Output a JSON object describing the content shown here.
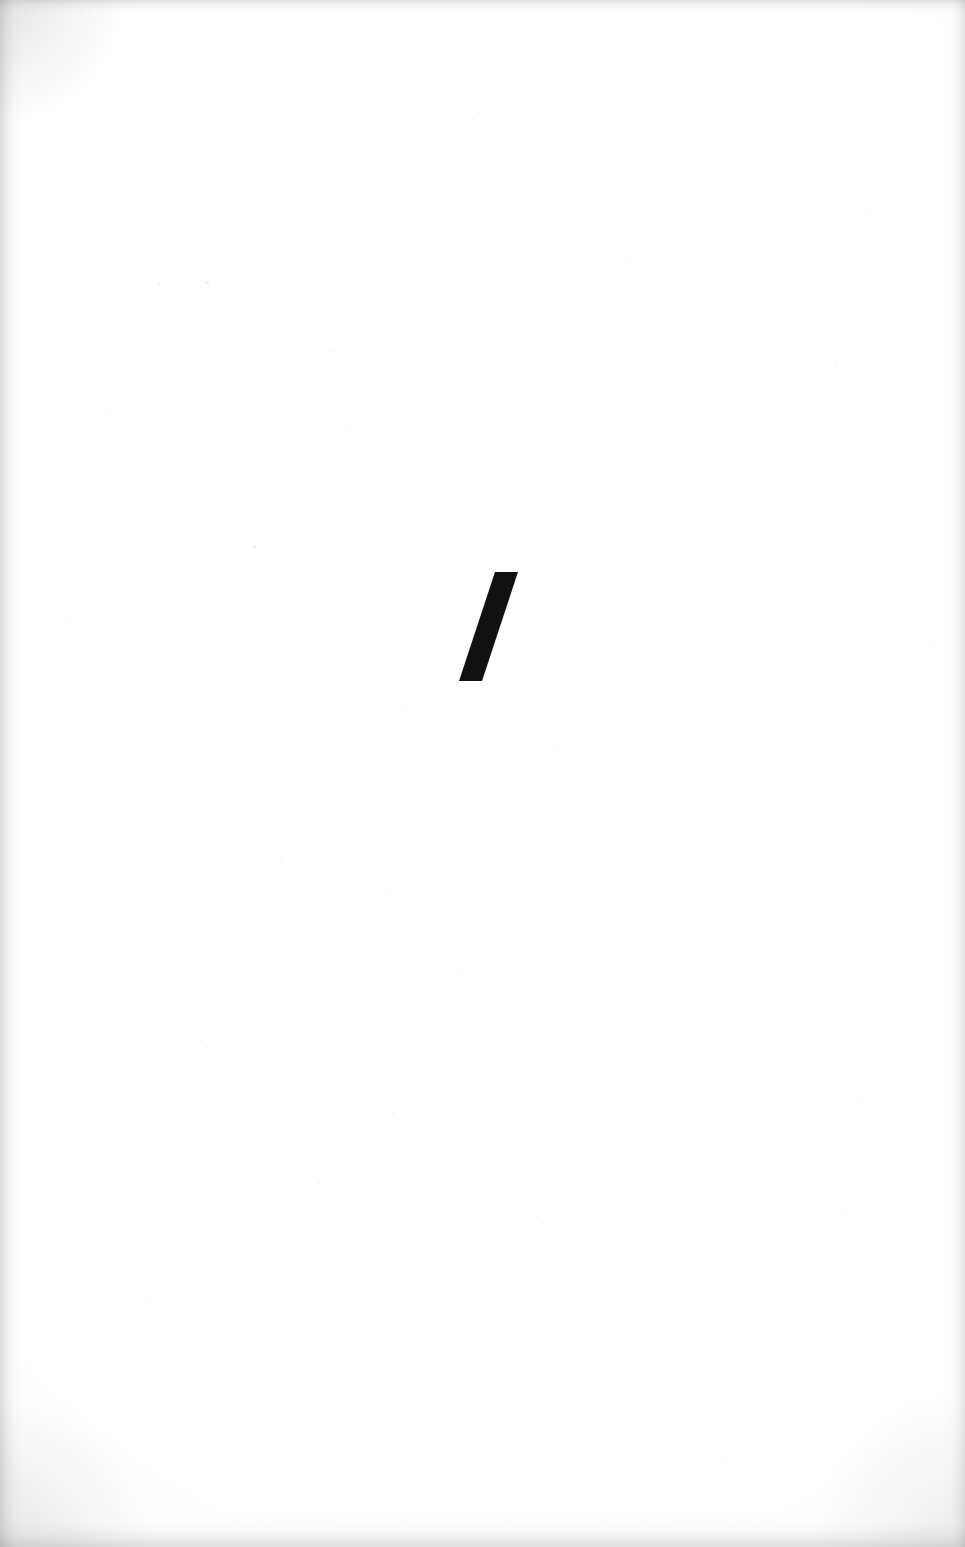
{
  "document": {
    "kind": "scanned-page",
    "page_background_color": "#fefefe",
    "canvas_width": 965,
    "canvas_height": 1547,
    "visible_text": "",
    "caption": ""
  },
  "marks": [
    {
      "id": "slash-stroke",
      "glyph": "/",
      "description": "bold italic slash stroke",
      "ink_color": "#111111",
      "x": 459,
      "y": 572,
      "width": 59,
      "height": 109,
      "stroke_thickness": 23,
      "slant_offset": 36
    }
  ],
  "scan_artifacts": {
    "edge_shadow_color": "#8e8e90",
    "speckle_color": "#bdbdbd",
    "top_band_height": 16,
    "bottom_band_height": 34,
    "left_band_width": 26,
    "right_band_width": 22,
    "speckles": [
      {
        "x": 206,
        "y": 281,
        "s": 3,
        "o": 0.3
      },
      {
        "x": 158,
        "y": 283,
        "s": 2,
        "o": 0.22
      },
      {
        "x": 253,
        "y": 545,
        "s": 3,
        "o": 0.26
      },
      {
        "x": 332,
        "y": 350,
        "s": 2,
        "o": 0.18
      },
      {
        "x": 345,
        "y": 425,
        "s": 2,
        "o": 0.16
      },
      {
        "x": 109,
        "y": 412,
        "s": 2,
        "o": 0.15
      },
      {
        "x": 512,
        "y": 103,
        "s": 2,
        "o": 0.17
      },
      {
        "x": 478,
        "y": 112,
        "s": 2,
        "o": 0.14
      },
      {
        "x": 626,
        "y": 258,
        "s": 2,
        "o": 0.16
      },
      {
        "x": 864,
        "y": 213,
        "s": 2,
        "o": 0.15
      },
      {
        "x": 835,
        "y": 362,
        "s": 2,
        "o": 0.14
      },
      {
        "x": 712,
        "y": 200,
        "s": 2,
        "o": 0.13
      },
      {
        "x": 404,
        "y": 710,
        "s": 2,
        "o": 0.17
      },
      {
        "x": 552,
        "y": 745,
        "s": 2,
        "o": 0.15
      },
      {
        "x": 627,
        "y": 742,
        "s": 2,
        "o": 0.13
      },
      {
        "x": 280,
        "y": 858,
        "s": 2,
        "o": 0.16
      },
      {
        "x": 390,
        "y": 892,
        "s": 2,
        "o": 0.14
      },
      {
        "x": 480,
        "y": 905,
        "s": 2,
        "o": 0.13
      },
      {
        "x": 765,
        "y": 975,
        "s": 2,
        "o": 0.15
      },
      {
        "x": 458,
        "y": 970,
        "s": 2,
        "o": 0.14
      },
      {
        "x": 200,
        "y": 1040,
        "s": 2,
        "o": 0.15
      },
      {
        "x": 290,
        "y": 1060,
        "s": 2,
        "o": 0.13
      },
      {
        "x": 392,
        "y": 1112,
        "s": 2,
        "o": 0.16
      },
      {
        "x": 670,
        "y": 1070,
        "s": 2,
        "o": 0.13
      },
      {
        "x": 860,
        "y": 1100,
        "s": 2,
        "o": 0.14
      },
      {
        "x": 318,
        "y": 1182,
        "s": 2,
        "o": 0.16
      },
      {
        "x": 124,
        "y": 1130,
        "s": 2,
        "o": 0.13
      },
      {
        "x": 536,
        "y": 1216,
        "s": 2,
        "o": 0.15
      },
      {
        "x": 604,
        "y": 1240,
        "s": 2,
        "o": 0.13
      },
      {
        "x": 844,
        "y": 1210,
        "s": 2,
        "o": 0.14
      },
      {
        "x": 908,
        "y": 1400,
        "s": 2,
        "o": 0.17
      },
      {
        "x": 948,
        "y": 1420,
        "s": 2,
        "o": 0.16
      },
      {
        "x": 872,
        "y": 1372,
        "s": 2,
        "o": 0.13
      },
      {
        "x": 720,
        "y": 1460,
        "s": 2,
        "o": 0.14
      },
      {
        "x": 150,
        "y": 1300,
        "s": 2,
        "o": 0.14
      },
      {
        "x": 250,
        "y": 1360,
        "s": 2,
        "o": 0.13
      },
      {
        "x": 430,
        "y": 1320,
        "s": 2,
        "o": 0.12
      },
      {
        "x": 600,
        "y": 1400,
        "s": 2,
        "o": 0.13
      },
      {
        "x": 68,
        "y": 620,
        "s": 2,
        "o": 0.16
      },
      {
        "x": 90,
        "y": 760,
        "s": 2,
        "o": 0.13
      },
      {
        "x": 55,
        "y": 960,
        "s": 2,
        "o": 0.14
      },
      {
        "x": 930,
        "y": 640,
        "s": 2,
        "o": 0.15
      },
      {
        "x": 900,
        "y": 820,
        "s": 2,
        "o": 0.13
      },
      {
        "x": 944,
        "y": 905,
        "s": 2,
        "o": 0.14
      }
    ]
  }
}
